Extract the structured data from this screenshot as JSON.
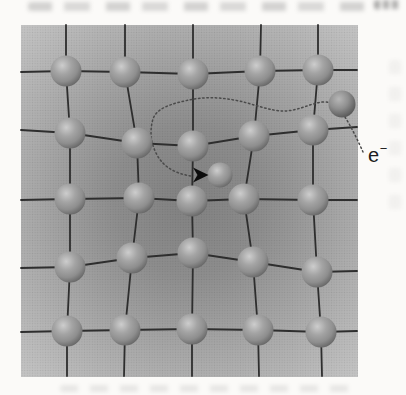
{
  "figure": {
    "type": "crystal-lattice-electron-capture-diagram",
    "electron_label": {
      "base": "e",
      "superscript": "−"
    },
    "colors": {
      "page_bg": "#fbfaf8",
      "bg_center": "#818181",
      "bg_mid": "#8d8d8d",
      "bg_outer": "#a8a8a8",
      "bg_edge": "#c6c6c6",
      "bond": "#2e2e2e",
      "trajectory": "#4a4a4a",
      "arrow": "#0d0d0d",
      "sphere_hi": "#cdcdcd",
      "sphere_mid": "#a4a4a4",
      "sphere_low": "#8e8e8e",
      "sphere_dark": "#666666",
      "electron_hi": "#b6b6b6",
      "electron_mid": "#8f8f8f",
      "electron_dark": "#565656",
      "halftone_dot": "#000000",
      "label_color": "#1c1c1c"
    },
    "square": {
      "x": 21,
      "y": 25,
      "width": 337,
      "height": 352
    },
    "gradient_focus": {
      "cx": 190,
      "cy": 200,
      "r": 250
    },
    "lattice": {
      "rows": 5,
      "cols": 5,
      "atom_radius": 15.5,
      "atoms": [
        [
          66,
          71
        ],
        [
          125,
          72
        ],
        [
          193,
          74
        ],
        [
          260,
          71
        ],
        [
          318,
          70
        ],
        [
          70,
          133
        ],
        [
          137,
          143
        ],
        [
          193,
          146
        ],
        [
          254,
          136
        ],
        [
          313,
          130
        ],
        [
          70,
          199
        ],
        [
          139,
          198
        ],
        [
          192,
          201
        ],
        [
          244,
          199
        ],
        [
          313,
          200
        ],
        [
          70,
          267
        ],
        [
          132,
          258
        ],
        [
          193,
          253
        ],
        [
          253,
          262
        ],
        [
          317,
          272
        ],
        [
          67,
          331
        ],
        [
          125,
          330
        ],
        [
          192,
          329
        ],
        [
          258,
          330
        ],
        [
          321,
          332
        ]
      ]
    },
    "bonds": [
      [
        [
          21,
          72
        ],
        [
          66,
          71
        ],
        [
          125,
          72
        ],
        [
          193,
          74
        ],
        [
          260,
          71
        ],
        [
          318,
          70
        ],
        [
          357,
          70
        ]
      ],
      [
        [
          21,
          130
        ],
        [
          70,
          133
        ],
        [
          137,
          143
        ],
        [
          193,
          146
        ],
        [
          254,
          136
        ],
        [
          313,
          130
        ],
        [
          357,
          127
        ]
      ],
      [
        [
          21,
          200
        ],
        [
          70,
          199
        ],
        [
          139,
          198
        ],
        [
          192,
          201
        ],
        [
          244,
          199
        ],
        [
          313,
          200
        ],
        [
          357,
          200
        ]
      ],
      [
        [
          21,
          268
        ],
        [
          70,
          267
        ],
        [
          132,
          258
        ],
        [
          193,
          253
        ],
        [
          253,
          262
        ],
        [
          317,
          272
        ],
        [
          357,
          271
        ]
      ],
      [
        [
          21,
          332
        ],
        [
          67,
          331
        ],
        [
          125,
          330
        ],
        [
          192,
          329
        ],
        [
          258,
          330
        ],
        [
          321,
          332
        ],
        [
          357,
          331
        ]
      ],
      [
        [
          66,
          25
        ],
        [
          66,
          71
        ],
        [
          70,
          133
        ],
        [
          70,
          199
        ],
        [
          70,
          267
        ],
        [
          67,
          331
        ],
        [
          67,
          376
        ]
      ],
      [
        [
          125,
          25
        ],
        [
          125,
          72
        ],
        [
          137,
          143
        ],
        [
          139,
          198
        ],
        [
          132,
          258
        ],
        [
          125,
          330
        ],
        [
          124,
          376
        ]
      ],
      [
        [
          193,
          25
        ],
        [
          193,
          74
        ],
        [
          193,
          146
        ],
        [
          192,
          201
        ],
        [
          193,
          253
        ],
        [
          192,
          329
        ],
        [
          192,
          376
        ]
      ],
      [
        [
          261,
          25
        ],
        [
          260,
          71
        ],
        [
          254,
          136
        ],
        [
          244,
          199
        ],
        [
          253,
          262
        ],
        [
          258,
          330
        ],
        [
          259,
          376
        ]
      ],
      [
        [
          318,
          25
        ],
        [
          318,
          70
        ],
        [
          313,
          130
        ],
        [
          313,
          200
        ],
        [
          317,
          272
        ],
        [
          321,
          332
        ],
        [
          322,
          376
        ]
      ]
    ],
    "trapped_electron": {
      "cx": 220,
      "cy": 175,
      "r": 12.5
    },
    "incoming_electron": {
      "cx": 342,
      "cy": 104,
      "r": 13.5
    },
    "trajectory_path": "M363,152 C359,143 352,128 345,117 C339,107 333,101 322,102 C309,104 297,111 284,111 C268,111 252,103 234,100 C218,97 203,97 189,100 C175,103 157,107 153,119 C150,129 150,141 156,153 C162,165 172,173 191,176",
    "trajectory_dash": "1.5 2.7",
    "arrowhead_points": "193,167.5 208.5,175 193,182.5 197.5,175"
  }
}
